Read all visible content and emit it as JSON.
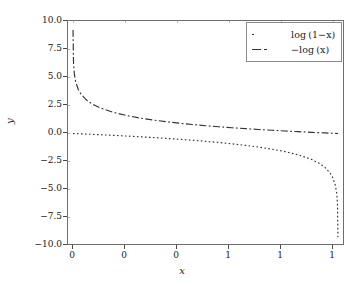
{
  "chart_data": {
    "type": "line",
    "title": "",
    "xlabel": "x",
    "ylabel": "y",
    "xlim": [
      0.0,
      1.0
    ],
    "ylim": [
      -10.0,
      10.0
    ],
    "grid": true,
    "legend_position": "upper right",
    "xticks": [
      0.0,
      0.2,
      0.4,
      0.6,
      0.8,
      1.0
    ],
    "xticklabels": [
      "0",
      "0",
      "0",
      "1",
      "1",
      "1"
    ],
    "yticks": [
      10.0,
      7.5,
      5.0,
      2.5,
      0.0,
      -2.5,
      -5.0,
      -7.5,
      -10.0
    ],
    "yticklabels": [
      "10.0",
      "7.5",
      "5.0",
      "2.5",
      "0.0",
      "−2.5",
      "−5.0",
      "−7.5",
      "−10.0"
    ],
    "series": [
      {
        "name": "log (1−x)",
        "linestyle": "dotted",
        "color": "#333333",
        "x": [
          0.0,
          0.02,
          0.05,
          0.1,
          0.15,
          0.2,
          0.25,
          0.3,
          0.35,
          0.4,
          0.45,
          0.5,
          0.55,
          0.6,
          0.65,
          0.7,
          0.75,
          0.8,
          0.85,
          0.9,
          0.93,
          0.95,
          0.97,
          0.98,
          0.99,
          0.995,
          0.998,
          0.9999
        ],
        "y": [
          0.0,
          -0.0202,
          -0.0513,
          -0.1054,
          -0.1625,
          -0.2231,
          -0.2877,
          -0.3567,
          -0.4308,
          -0.5108,
          -0.5978,
          -0.6931,
          -0.7985,
          -0.9163,
          -1.0498,
          -1.204,
          -1.3863,
          -1.6094,
          -1.8971,
          -2.3026,
          -2.6593,
          -2.9957,
          -3.5066,
          -3.912,
          -4.6052,
          -5.2983,
          -6.2146,
          -9.2103
        ]
      },
      {
        "name": "−log (x)",
        "linestyle": "dashdot",
        "color": "#333333",
        "x": [
          0.0001,
          0.002,
          0.005,
          0.01,
          0.02,
          0.03,
          0.05,
          0.07,
          0.1,
          0.15,
          0.2,
          0.25,
          0.3,
          0.35,
          0.4,
          0.45,
          0.5,
          0.55,
          0.6,
          0.65,
          0.7,
          0.75,
          0.8,
          0.85,
          0.9,
          0.95,
          1.0
        ],
        "y": [
          9.2103,
          6.2146,
          5.2983,
          4.6052,
          3.912,
          3.5066,
          2.9957,
          2.6593,
          2.3026,
          1.8971,
          1.6094,
          1.3863,
          1.204,
          1.0498,
          0.9163,
          0.7985,
          0.6931,
          0.5978,
          0.5108,
          0.4308,
          0.3567,
          0.2877,
          0.2231,
          0.1625,
          0.1054,
          0.0513,
          0.0
        ]
      }
    ]
  },
  "legend": {
    "entries": [
      {
        "label": "log (1−x)",
        "style": "dotted"
      },
      {
        "label": "−log (x)",
        "style": "dashdot"
      }
    ]
  },
  "axes": {
    "x_title": "x",
    "y_title": "y"
  },
  "colors": {
    "background": "#ffffff",
    "frame": "#6e6e6e",
    "grid": "#b9b9b9",
    "curve": "#333333",
    "text": "#1a1a1a"
  }
}
